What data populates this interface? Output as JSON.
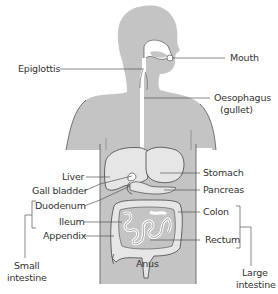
{
  "diagram": {
    "colors": {
      "body": "#c4c4c4",
      "organ": "#e6e6e6",
      "tract": "#ffffff",
      "outline": "#4a4a4a",
      "leader": "#555555",
      "text": "#333333"
    },
    "labels": {
      "mouth": "Mouth",
      "epiglottis": "Epiglottis",
      "oesophagus_line1": "Oesophagus",
      "oesophagus_line2": "(gullet)",
      "liver": "Liver",
      "stomach": "Stomach",
      "gall_bladder": "Gall bladder",
      "pancreas": "Pancreas",
      "duodenum": "Duodenum",
      "colon": "Colon",
      "ileum": "Ileum",
      "appendix": "Appendix",
      "rectum": "Rectum",
      "anus": "Anus",
      "small_intestine_line1": "Small",
      "small_intestine_line2": "intestine",
      "large_intestine_line1": "Large",
      "large_intestine_line2": "intestine"
    }
  }
}
